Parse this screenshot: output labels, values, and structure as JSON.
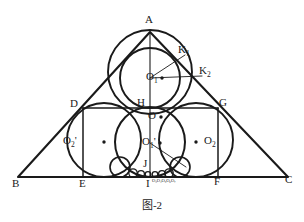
{
  "figure": {
    "caption": "图-2",
    "stroke_color": "#1a1a1a",
    "background": "#ffffff"
  },
  "labels": {
    "A": "A",
    "B": "B",
    "C": "C",
    "D": "D",
    "E": "E",
    "F": "F",
    "G": "G",
    "H": "H",
    "I": "I",
    "J": "J",
    "O": "O",
    "O1": "O",
    "O1_sub": "1",
    "O1p": "O",
    "O1p_sub": "1",
    "O1p_prime": "'",
    "O2": "O",
    "O2_sub": "2",
    "O2p": "O",
    "O2p_sub": "2",
    "O2p_prime": "'",
    "K1": "K",
    "K1_sub": "1",
    "K2": "K",
    "K2_sub": "2",
    "small_circle_centers": "O₃O₄O₅O₆O₇"
  },
  "geometry": {
    "triangle": {
      "A": [
        150,
        32
      ],
      "B": [
        18,
        177
      ],
      "C": [
        288,
        177
      ]
    },
    "baseline_y": 177,
    "dg_line_y": 108,
    "points": {
      "D": [
        83,
        108
      ],
      "G": [
        218,
        108
      ],
      "E": [
        83,
        177
      ],
      "F": [
        218,
        177
      ],
      "H": [
        150,
        108
      ],
      "I": [
        150,
        177
      ],
      "J": [
        150,
        167
      ],
      "O": [
        150,
        117
      ],
      "O1": [
        150,
        78
      ],
      "O1p": [
        150,
        143
      ],
      "O2": [
        203,
        142
      ],
      "O2p": [
        97,
        142
      ],
      "K1": [
        185,
        55
      ],
      "K2": [
        202,
        76
      ]
    },
    "circles": [
      {
        "name": "incircle",
        "cx": 150,
        "cy": 72,
        "r": 42
      },
      {
        "name": "circle-O1",
        "cx": 150,
        "cy": 78,
        "r": 30
      },
      {
        "name": "circle-O1-prime",
        "cx": 150,
        "cy": 142,
        "r": 35
      },
      {
        "name": "circle-O2-prime",
        "cx": 104,
        "cy": 140,
        "r": 37
      },
      {
        "name": "circle-O2",
        "cx": 196,
        "cy": 140,
        "r": 37
      },
      {
        "name": "small-left",
        "cx": 120,
        "cy": 167,
        "r": 10
      },
      {
        "name": "small-right",
        "cx": 180,
        "cy": 167,
        "r": 10
      }
    ],
    "chain_circles": [
      {
        "cx": 133,
        "cy": 173,
        "r": 4.2
      },
      {
        "cx": 141,
        "cy": 174,
        "r": 3.4
      },
      {
        "cx": 148,
        "cy": 174.5,
        "r": 2.8
      },
      {
        "cx": 155,
        "cy": 174.5,
        "r": 2.8
      },
      {
        "cx": 162,
        "cy": 174,
        "r": 3.4
      },
      {
        "cx": 169,
        "cy": 173,
        "r": 4.2
      }
    ]
  }
}
